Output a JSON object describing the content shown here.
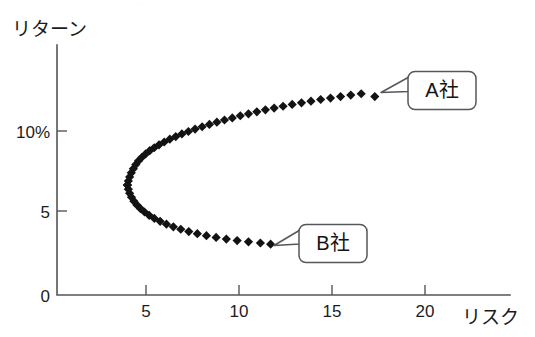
{
  "figure": {
    "background_color": "#ffffff",
    "axis_color": "#54565a",
    "marker_color": "#131313",
    "callout_border_color": "#55575b"
  },
  "axes": {
    "y_title": "リターン",
    "x_title": "リスク",
    "y_ticks": [
      "0",
      "5",
      "10%"
    ],
    "x_ticks": [
      "5",
      "10",
      "15",
      "20"
    ]
  },
  "callouts": [
    {
      "id": "company-a",
      "label": "A社"
    },
    {
      "id": "company-b",
      "label": "B社"
    }
  ],
  "top_scan_artifact": "· ··  ·· ·   ·· · ··· ·· ·· ····",
  "chart_data": {
    "type": "scatter",
    "title": "",
    "subtitle": "",
    "xlabel": "リスク",
    "ylabel": "リターン",
    "xlim": [
      0,
      24.5
    ],
    "ylim": [
      0,
      13.5
    ],
    "grid": false,
    "legend": null,
    "x_tick_values": [
      5,
      10,
      15,
      20
    ],
    "y_tick_values": [
      0,
      5,
      10
    ],
    "y_tick_labels": [
      "0",
      "5",
      "10%"
    ],
    "marker": "filled-diamond",
    "annotations": [
      {
        "label": "A社",
        "x": 17.3,
        "y": 12.1,
        "note": "upper branch endpoint"
      },
      {
        "label": "B社",
        "x": 11.7,
        "y": 3.1,
        "note": "lower branch endpoint"
      }
    ],
    "vertex": {
      "x": 4.0,
      "y": 6.7
    },
    "series": [
      {
        "name": "upper-branch",
        "points": [
          [
            4.0,
            6.7
          ],
          [
            4.02,
            6.95
          ],
          [
            4.06,
            7.2
          ],
          [
            4.13,
            7.45
          ],
          [
            4.22,
            7.7
          ],
          [
            4.34,
            7.95
          ],
          [
            4.48,
            8.2
          ],
          [
            4.64,
            8.45
          ],
          [
            4.83,
            8.7
          ],
          [
            5.04,
            8.95
          ],
          [
            5.27,
            9.2
          ],
          [
            5.52,
            9.45
          ],
          [
            5.79,
            9.7
          ],
          [
            6.08,
            9.95
          ],
          [
            6.38,
            10.2
          ],
          [
            6.7,
            10.45
          ],
          [
            7.03,
            10.7
          ],
          [
            7.38,
            10.95
          ],
          [
            7.74,
            11.2
          ],
          [
            8.11,
            11.45
          ],
          [
            8.49,
            11.7
          ],
          [
            8.89,
            11.95
          ],
          [
            9.29,
            12.2
          ],
          [
            9.7,
            12.45
          ],
          [
            10.12,
            12.7
          ],
          [
            10.55,
            12.95
          ],
          [
            10.98,
            13.2
          ],
          [
            11.42,
            13.45
          ],
          [
            11.87,
            13.7
          ],
          [
            12.32,
            13.95
          ],
          [
            12.78,
            14.2
          ],
          [
            13.24,
            14.45
          ],
          [
            13.71,
            14.7
          ],
          [
            14.18,
            14.95
          ],
          [
            14.66,
            15.2
          ],
          [
            15.14,
            15.45
          ],
          [
            15.62,
            15.7
          ],
          [
            16.11,
            15.95
          ],
          [
            16.6,
            16.2
          ],
          [
            17.3,
            16.5
          ]
        ],
        "note": "x,y stored in data units before vertical remap; rendered y = vertex-relative"
      },
      {
        "name": "lower-branch",
        "points": [
          [
            4.0,
            6.7
          ],
          [
            4.02,
            6.45
          ],
          [
            4.06,
            6.2
          ],
          [
            4.13,
            5.95
          ],
          [
            4.22,
            5.7
          ],
          [
            4.34,
            5.45
          ],
          [
            4.5,
            5.2
          ],
          [
            4.69,
            4.95
          ],
          [
            4.91,
            4.7
          ],
          [
            5.16,
            4.45
          ],
          [
            5.44,
            4.2
          ],
          [
            5.75,
            3.95
          ],
          [
            6.09,
            3.7
          ],
          [
            6.46,
            3.45
          ],
          [
            6.86,
            3.2
          ],
          [
            7.28,
            2.95
          ],
          [
            7.73,
            2.7
          ],
          [
            8.2,
            2.45
          ],
          [
            8.7,
            2.2
          ],
          [
            9.22,
            1.95
          ],
          [
            9.76,
            1.7
          ],
          [
            10.32,
            1.45
          ],
          [
            10.9,
            1.2
          ],
          [
            11.7,
            0.95
          ]
        ]
      }
    ],
    "rendered_points_upper": [
      [
        4.0,
        6.7
      ],
      [
        4.05,
        6.95
      ],
      [
        4.12,
        7.2
      ],
      [
        4.21,
        7.45
      ],
      [
        4.32,
        7.7
      ],
      [
        4.45,
        7.95
      ],
      [
        4.6,
        8.18
      ],
      [
        4.78,
        8.4
      ],
      [
        4.98,
        8.6
      ],
      [
        5.2,
        8.8
      ],
      [
        5.44,
        8.98
      ],
      [
        5.7,
        9.16
      ],
      [
        5.98,
        9.33
      ],
      [
        6.28,
        9.5
      ],
      [
        6.6,
        9.66
      ],
      [
        6.93,
        9.82
      ],
      [
        7.28,
        9.97
      ],
      [
        7.64,
        10.12
      ],
      [
        8.02,
        10.26
      ],
      [
        8.41,
        10.4
      ],
      [
        8.81,
        10.54
      ],
      [
        9.22,
        10.67
      ],
      [
        9.64,
        10.8
      ],
      [
        10.07,
        10.93
      ],
      [
        10.51,
        11.05
      ],
      [
        10.96,
        11.17
      ],
      [
        11.42,
        11.29
      ],
      [
        11.89,
        11.4
      ],
      [
        12.37,
        11.51
      ],
      [
        12.86,
        11.62
      ],
      [
        13.36,
        11.72
      ],
      [
        13.87,
        11.82
      ],
      [
        14.39,
        11.92
      ],
      [
        14.92,
        12.01
      ],
      [
        15.46,
        12.1
      ],
      [
        16.01,
        12.19
      ],
      [
        16.57,
        12.27
      ],
      [
        17.3,
        12.1
      ]
    ],
    "rendered_points_lower": [
      [
        4.0,
        6.7
      ],
      [
        4.05,
        6.45
      ],
      [
        4.12,
        6.2
      ],
      [
        4.22,
        5.96
      ],
      [
        4.35,
        5.72
      ],
      [
        4.51,
        5.49
      ],
      [
        4.7,
        5.27
      ],
      [
        4.92,
        5.06
      ],
      [
        5.17,
        4.86
      ],
      [
        5.45,
        4.67
      ],
      [
        5.76,
        4.49
      ],
      [
        6.1,
        4.32
      ],
      [
        6.47,
        4.16
      ],
      [
        6.87,
        4.01
      ],
      [
        7.3,
        3.87
      ],
      [
        7.76,
        3.74
      ],
      [
        8.25,
        3.62
      ],
      [
        8.77,
        3.51
      ],
      [
        9.32,
        3.41
      ],
      [
        9.9,
        3.32
      ],
      [
        10.51,
        3.24
      ],
      [
        11.15,
        3.17
      ],
      [
        11.7,
        3.1
      ]
    ]
  }
}
